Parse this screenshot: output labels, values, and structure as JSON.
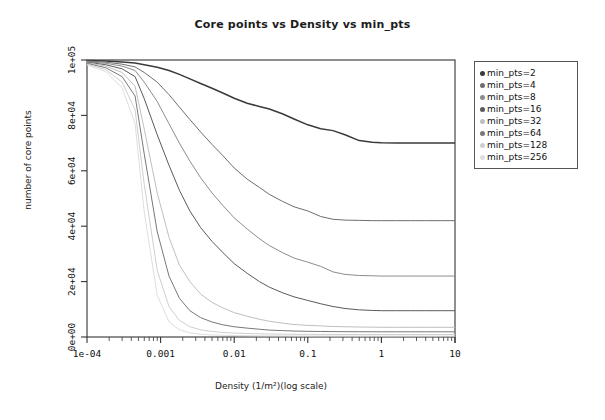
{
  "chart_data": {
    "type": "line",
    "title": "Core points vs Density vs min_pts",
    "xlabel": "Density (1/m²)(log scale)",
    "ylabel": "number of core points",
    "xscale": "log",
    "yscale": "linear",
    "xlim": [
      0.0001,
      10
    ],
    "ylim": [
      0,
      100000
    ],
    "grid": false,
    "legend_position": "top-right-outside",
    "xticks": [
      "1e-04",
      "0.001",
      "0.01",
      "0.1",
      "1",
      "10"
    ],
    "xtick_values": [
      0.0001,
      0.001,
      0.01,
      0.1,
      1,
      10
    ],
    "yticks": [
      "0e+00",
      "2e+04",
      "4e+04",
      "6e+04",
      "8e+04",
      "1e+05"
    ],
    "ytick_values": [
      0,
      20000,
      40000,
      60000,
      80000,
      100000
    ],
    "x": [
      0.0001,
      0.00018,
      0.0003,
      0.00045,
      0.0006,
      0.0009,
      0.0013,
      0.0018,
      0.0025,
      0.0035,
      0.005,
      0.007,
      0.01,
      0.015,
      0.022,
      0.03,
      0.045,
      0.065,
      0.1,
      0.15,
      0.22,
      0.32,
      0.5,
      0.75,
      1.0,
      1.6,
      2.5,
      4.0,
      6.5,
      10.0
    ],
    "series": [
      {
        "name": "min_pts=2",
        "color": "#3a3a3a",
        "values": [
          99800,
          99600,
          99300,
          98900,
          98300,
          97400,
          96200,
          94800,
          93200,
          91500,
          89800,
          88100,
          86200,
          84400,
          83200,
          82300,
          80600,
          78700,
          76600,
          75200,
          74500,
          73000,
          70900,
          70300,
          70100,
          70000,
          70000,
          70000,
          70000,
          70000
        ]
      },
      {
        "name": "min_pts=4",
        "color": "#6e6e6e",
        "values": [
          99600,
          99200,
          98500,
          97500,
          95500,
          92000,
          87500,
          83000,
          78500,
          74000,
          69500,
          65500,
          61000,
          57000,
          54000,
          51500,
          49000,
          47000,
          45500,
          43500,
          42500,
          42200,
          42100,
          42000,
          42000,
          42000,
          42000,
          42000,
          42000,
          42000
        ]
      },
      {
        "name": "min_pts=8",
        "color": "#8c8c8c",
        "values": [
          99400,
          98800,
          97800,
          96200,
          92000,
          85000,
          77000,
          70000,
          63500,
          57500,
          52000,
          47500,
          43000,
          39000,
          35500,
          33000,
          30500,
          28500,
          27000,
          25500,
          23500,
          22600,
          22200,
          22100,
          22000,
          22000,
          22000,
          22000,
          22000,
          22000
        ]
      },
      {
        "name": "min_pts=16",
        "color": "#5a5a5a",
        "values": [
          99200,
          98300,
          96800,
          94000,
          86000,
          73000,
          62000,
          53000,
          45500,
          39500,
          34500,
          30500,
          26500,
          23000,
          20000,
          18000,
          16000,
          14500,
          13200,
          12000,
          11000,
          10300,
          9800,
          9600,
          9500,
          9500,
          9500,
          9500,
          9500,
          9500
        ]
      },
      {
        "name": "min_pts=32",
        "color": "#bfbfbf",
        "values": [
          99000,
          97800,
          95500,
          90500,
          75000,
          52000,
          36000,
          26000,
          20000,
          15500,
          12500,
          10500,
          8800,
          7500,
          6400,
          5700,
          5000,
          4500,
          4200,
          4000,
          3800,
          3700,
          3600,
          3550,
          3500,
          3500,
          3500,
          3500,
          3500,
          3500
        ]
      },
      {
        "name": "min_pts=64",
        "color": "#787878",
        "values": [
          98800,
          97200,
          94000,
          87000,
          66000,
          38000,
          22000,
          14000,
          9500,
          7000,
          5400,
          4400,
          3700,
          3200,
          2800,
          2500,
          2300,
          2150,
          2050,
          2000,
          1950,
          1920,
          1900,
          1890,
          1880,
          1880,
          1880,
          1880,
          1880,
          1880
        ]
      },
      {
        "name": "min_pts=128",
        "color": "#cfcfcf",
        "values": [
          98500,
          96500,
          92000,
          82000,
          55000,
          24000,
          11000,
          6000,
          3700,
          2600,
          2000,
          1650,
          1400,
          1250,
          1150,
          1080,
          1020,
          980,
          950,
          930,
          915,
          905,
          900,
          895,
          890,
          890,
          890,
          890,
          890,
          890
        ]
      },
      {
        "name": "min_pts=256",
        "color": "#dedede",
        "values": [
          98200,
          95800,
          90000,
          77000,
          45000,
          15000,
          5500,
          2600,
          1500,
          1000,
          760,
          620,
          530,
          470,
          430,
          405,
          385,
          370,
          360,
          352,
          346,
          342,
          339,
          337,
          335,
          335,
          335,
          335,
          335,
          335
        ]
      }
    ]
  },
  "legend": {
    "items": [
      {
        "label": "min_pts=2"
      },
      {
        "label": "min_pts=4"
      },
      {
        "label": "min_pts=8"
      },
      {
        "label": "min_pts=16"
      },
      {
        "label": "min_pts=32"
      },
      {
        "label": "min_pts=64"
      },
      {
        "label": "min_pts=128"
      },
      {
        "label": "min_pts=256"
      }
    ]
  },
  "axes": {
    "frame_color": "#333333",
    "tick_color": "#333333"
  }
}
